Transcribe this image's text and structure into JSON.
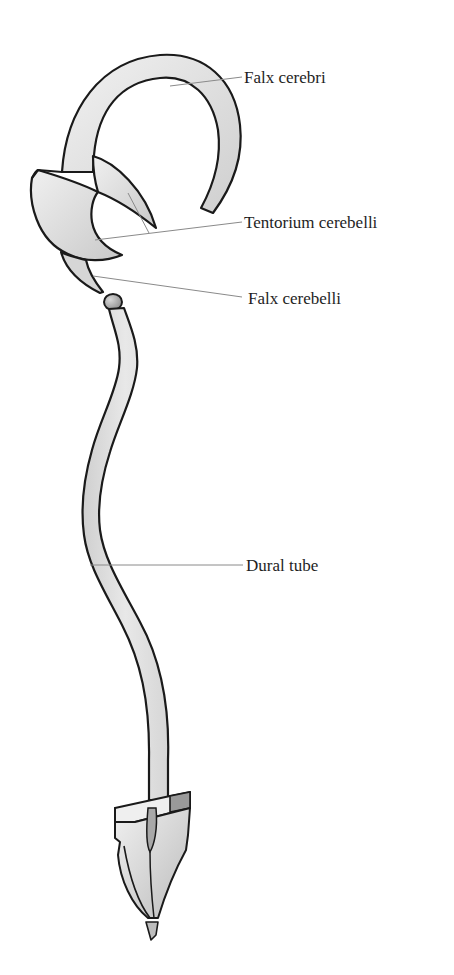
{
  "figure": {
    "labels": [
      {
        "id": "falx-cerebri",
        "text": "Falx cerebri"
      },
      {
        "id": "tentorium-cerebelli",
        "text": "Tentorium cerebelli"
      },
      {
        "id": "falx-cerebelli",
        "text": "Falx cerebelli"
      },
      {
        "id": "dural-tube",
        "text": "Dural tube"
      }
    ],
    "colors": {
      "outline": "#1a1a1a",
      "fill_light": "#e6e6e6",
      "fill_mid": "#d2d2d2",
      "fill_dark": "#a9a9a9",
      "leader_line": "#8a8a8a",
      "label_text": "#1e1e1e"
    }
  }
}
